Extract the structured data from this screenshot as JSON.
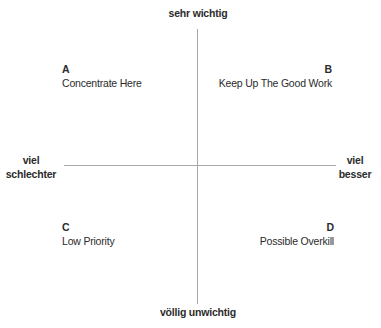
{
  "axes": {
    "top": "sehr wichtig",
    "bottom": "völlig unwichtig",
    "left": [
      "viel",
      "schlechter"
    ],
    "right": [
      "viel",
      "besser"
    ],
    "color": "#a8a8a8"
  },
  "quadrants": [
    {
      "id": "A",
      "letter": "A",
      "label": "Concentrate Here",
      "position": "top-left"
    },
    {
      "id": "B",
      "letter": "B",
      "label": "Keep Up The Good Work",
      "position": "top-right"
    },
    {
      "id": "C",
      "letter": "C",
      "label": "Low Priority",
      "position": "bottom-left"
    },
    {
      "id": "D",
      "letter": "D",
      "label": "Possible Overkill",
      "position": "bottom-right"
    }
  ]
}
